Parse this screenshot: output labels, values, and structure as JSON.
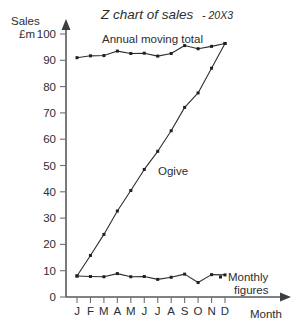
{
  "chart_data": {
    "type": "line",
    "title": "Z chart of sales",
    "title_year": "- 20X3",
    "xlabel": "Month",
    "ylabel_line1": "Sales",
    "ylabel_line2": "£m",
    "categories": [
      "J",
      "F",
      "M",
      "A",
      "M",
      "J",
      "J",
      "A",
      "S",
      "O",
      "N",
      "D"
    ],
    "category_names": [
      "January",
      "February",
      "March",
      "April",
      "May",
      "June",
      "July",
      "August",
      "September",
      "October",
      "November",
      "December"
    ],
    "ylim": [
      0,
      100
    ],
    "yticks": [
      0,
      10,
      20,
      30,
      40,
      50,
      60,
      70,
      80,
      90,
      100
    ],
    "ytick_labels": [
      "0",
      "10",
      "20",
      "30",
      "40",
      "50",
      "60",
      "70",
      "80",
      "90",
      "100"
    ],
    "grid": false,
    "legend_position": "inline-annotations",
    "series": [
      {
        "name": "Annual moving total",
        "label": "Annual moving total",
        "values": [
          91.0,
          91.7,
          91.8,
          93.5,
          92.6,
          92.7,
          91.6,
          92.6,
          95.6,
          94.4,
          95.3,
          96.4
        ]
      },
      {
        "name": "Ogive",
        "label": "Ogive",
        "values": [
          8.0,
          15.8,
          23.8,
          32.7,
          40.5,
          48.5,
          55.4,
          63.2,
          72.1,
          77.6,
          87.0,
          96.4
        ]
      },
      {
        "name": "Monthly figures",
        "label_line1": "Monthly",
        "label_line2": "figures",
        "values": [
          8.0,
          7.8,
          7.7,
          8.9,
          7.7,
          7.8,
          6.7,
          7.5,
          8.7,
          5.5,
          8.5,
          8.4
        ]
      }
    ],
    "annotations": [
      {
        "text": "Annual moving total",
        "for_series": "Annual moving total"
      },
      {
        "text": "Ogive",
        "for_series": "Ogive"
      },
      {
        "text": "Monthly figures",
        "for_series": "Monthly figures"
      }
    ],
    "colors": {
      "line": "#2b2f33",
      "axis": "#555a5e",
      "text": "#2a2e31",
      "background": "#ffffff"
    }
  }
}
